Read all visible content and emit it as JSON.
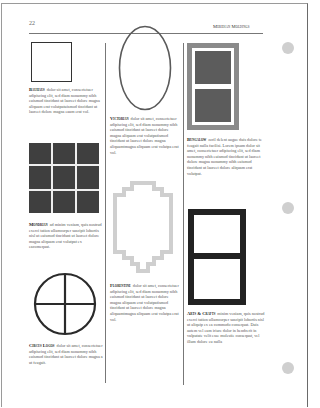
{
  "header": {
    "page_number": "22",
    "running_head": "Meridian Moldings"
  },
  "columns": [
    {
      "entries": [
        {
          "title": "Bauhaus",
          "text": "dolor sit amet, consectetuer adipiscing elit, sed diam nonummy nibh euismod tincidunt ut laoreet dolore magna aliquam erat volutpatuismod tincidunt ut laoreet dolore magna eaum erat vol.",
          "graphic": "square-outline"
        },
        {
          "title": "Mondrian",
          "text": "ad minim veniam, quis nostrud exerci tation ullamcorper suscipit lobortis nisl ut euismod tincidunt ut laoreet dolore magna aliquam erat volutpat ex eacomequat.",
          "graphic": "nine-grid"
        },
        {
          "title": "Circus Logos",
          "text": "dolor sit amet, consectetuer adipiscing elit, sed diam nonummy nibh euismod tincidunt ut laoreet dolore magna a ut feugait.",
          "graphic": "circle-cross"
        }
      ]
    },
    {
      "entries": [
        {
          "title": "Victorian",
          "text": "dolor sit amet, consectetuer adipiscing elit, sed diam nonummy nibh euismod tincidunt ut laoreet dolore magna aliquam erat volutpatismod tincidunt ut laoreet dolore magna aliquamtmagna aliquam erat volutpa erat vol.",
          "graphic": "oval-outline"
        },
        {
          "title": "Florentine",
          "text": "dolor sit amet, consectetuer adipiscing elit, sed diam nonummy nibh euismod tincidunt ut laoreet dolore magna aliquam erat volutpatismod tincidunt ut laoreet dolore magna aliquamtmagna aliquam erat volutpa erat vol.",
          "graphic": "stepped-frame"
        }
      ]
    },
    {
      "entries": [
        {
          "title": "Bungalow",
          "text": "zzril delent augue duis dolore te feugait nulla facilisi. Lorem ipsum dolor sit amet, consectetuer adipiscing elit, sed diam nonummy nibh euismod tincidunt ut laoreet dolore magna nonummy nibh euismod tincidunt ut laoreet dolore aliquam erat volutpat.",
          "graphic": "gray-double-panel"
        },
        {
          "title": "Arts & Crafts",
          "text": "minim veniam, quis nostrud exerci tation ullamcorper suscipit lobortis nisl ut aliquip ex ea commodo consequat. Duis autem vel eum iriure dolor in hendrerit in vulputate velit esse molestie consequat, vel illum dolore eu nulla",
          "graphic": "black-double-panel"
        }
      ]
    }
  ],
  "colors": {
    "rule": "#777777",
    "panel_gray": "#8a8a8a",
    "panel_dark": "#5c5c5c",
    "grid_dark": "#3f3f3f",
    "black_frame": "#222222",
    "oval_stroke": "#5a5a5a",
    "florentine_stroke": "#cfcfcf",
    "punch_hole": "#cfcfcf"
  }
}
